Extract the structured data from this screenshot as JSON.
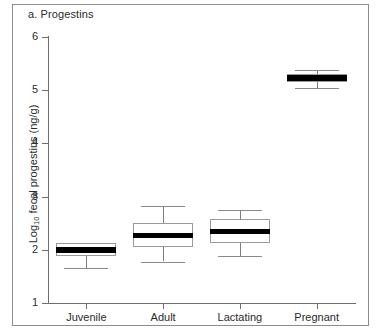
{
  "figure": {
    "panel_title": "a. Progestins",
    "y_axis_title_main": "Log",
    "y_axis_title_sub": "10",
    "y_axis_title_rest": " fecal progestins (ng/g)",
    "background_color": "#ffffff",
    "frame_color": "#8c8c8c",
    "axis_color": "#6e6e6e",
    "box_outline_color": "#9a9a9a",
    "median_color": "#000000",
    "whisker_color": "#7d7d7d"
  },
  "chart_data": {
    "type": "boxplot",
    "title": "a. Progestins",
    "xlabel": "",
    "ylabel": "Log10 fecal progestins (ng/g)",
    "ylim": [
      1,
      6
    ],
    "yticks": [
      1,
      2,
      3,
      4,
      5,
      6
    ],
    "ytick_labels": [
      "1",
      "2",
      "3",
      "4",
      "5",
      "6"
    ],
    "grid": false,
    "legend": false,
    "categories": [
      "Juvenile",
      "Adult",
      "Lactating",
      "Pregnant"
    ],
    "boxes": [
      {
        "label": "Juvenile",
        "whisker_low": 1.65,
        "q1": 1.88,
        "median": 2.0,
        "q3": 2.12,
        "whisker_high": null,
        "has_upper_whisker": false
      },
      {
        "label": "Adult",
        "whisker_low": 1.78,
        "q1": 2.05,
        "median": 2.27,
        "q3": 2.5,
        "whisker_high": 2.82,
        "has_upper_whisker": true
      },
      {
        "label": "Lactating",
        "whisker_low": 1.88,
        "q1": 2.13,
        "median": 2.35,
        "q3": 2.57,
        "whisker_high": 2.75,
        "has_upper_whisker": true
      },
      {
        "label": "Pregnant",
        "whisker_low": 5.05,
        "q1": 5.15,
        "median": 5.22,
        "q3": 5.3,
        "whisker_high": 5.38,
        "has_upper_whisker": true
      }
    ]
  }
}
